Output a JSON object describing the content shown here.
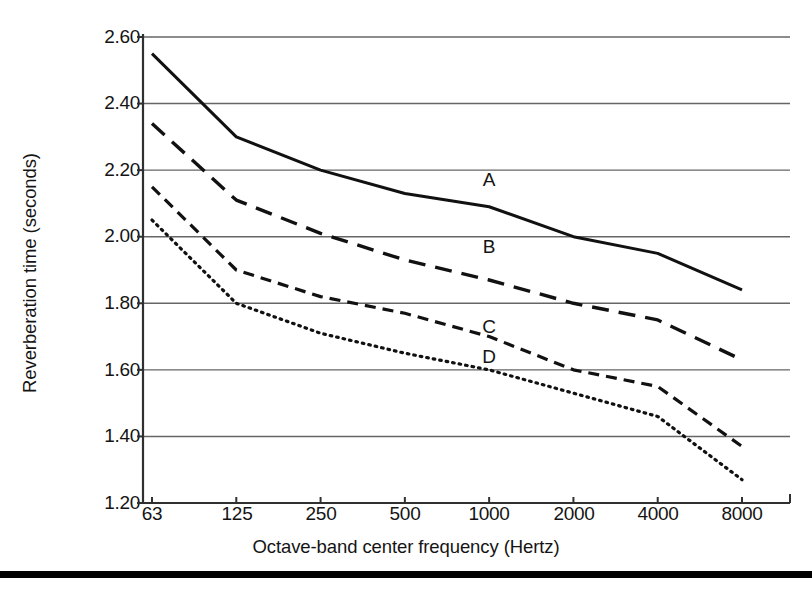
{
  "chart_data": {
    "type": "line",
    "title": "",
    "xlabel": "Octave-band center frequency (Hertz)",
    "ylabel": "Reverberation time (seconds)",
    "x_scale": "log2-categorical",
    "categories": [
      63,
      125,
      250,
      500,
      1000,
      2000,
      4000,
      8000
    ],
    "xtick_labels": [
      "63",
      "125",
      "250",
      "500",
      "1000",
      "2000",
      "4000",
      "8000"
    ],
    "ytick_labels": [
      "2.60",
      "2.40",
      "2.20",
      "2.00",
      "1.80",
      "1.60",
      "1.40",
      "1.20"
    ],
    "ytick_values": [
      2.6,
      2.4,
      2.2,
      2.0,
      1.8,
      1.6,
      1.4,
      1.2
    ],
    "ylim": [
      1.2,
      2.6
    ],
    "grid": "horizontal",
    "legend_position": "inline-labels",
    "series": [
      {
        "name": "A",
        "line_style": "solid",
        "color": "#111111",
        "label_x_category": 1000,
        "label_value": 2.17,
        "values": [
          2.55,
          2.3,
          2.2,
          2.13,
          2.09,
          2.0,
          1.95,
          1.84
        ]
      },
      {
        "name": "B",
        "line_style": "dashed",
        "color": "#111111",
        "label_x_category": 1000,
        "label_value": 1.97,
        "values": [
          2.34,
          2.11,
          2.01,
          1.93,
          1.87,
          1.8,
          1.75,
          1.63
        ]
      },
      {
        "name": "C",
        "line_style": "short-dashed",
        "color": "#111111",
        "label_x_category": 1000,
        "label_value": 1.73,
        "values": [
          2.15,
          1.9,
          1.82,
          1.77,
          1.7,
          1.6,
          1.55,
          1.37
        ]
      },
      {
        "name": "D",
        "line_style": "dotted",
        "color": "#111111",
        "label_x_category": 1000,
        "label_value": 1.64,
        "values": [
          2.05,
          1.8,
          1.71,
          1.65,
          1.6,
          1.53,
          1.46,
          1.27
        ]
      }
    ]
  },
  "axis": {
    "y_title": "Reverberation time (seconds)",
    "x_title": "Octave-band center frequency (Hertz)"
  },
  "colors": {
    "ink": "#141414",
    "grid": "#666666",
    "rule": "#000000"
  }
}
